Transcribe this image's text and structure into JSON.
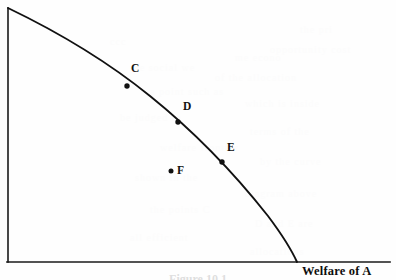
{
  "figure": {
    "caption": "Figure 10.1",
    "background_color": "#fefefe",
    "ink_color": "#111111"
  },
  "axes": {
    "x_label": "Welfare of A",
    "y_label": "",
    "x_axis_name": "horizontal-axis",
    "y_axis_name": "vertical-axis",
    "origin_px": [
      8,
      262
    ],
    "x_axis_end_px": [
      390,
      262
    ],
    "y_axis_end_px": [
      8,
      8
    ]
  },
  "chart_data": {
    "type": "line",
    "title": "",
    "subtitle": "",
    "xlabel": "Welfare of A",
    "ylabel": "",
    "xlim": [
      0,
      1
    ],
    "ylim": [
      0,
      1
    ],
    "grid": false,
    "legend": "none",
    "series": [
      {
        "name": "utility-possibility-frontier",
        "description": "Concave welfare frontier falling from the vertical axis to the horizontal axis",
        "x": [
          0.0,
          0.08,
          0.17,
          0.25,
          0.34,
          0.42,
          0.5,
          0.57,
          0.63,
          0.68,
          0.72,
          0.75,
          0.755
        ],
        "y": [
          1.0,
          0.93,
          0.86,
          0.79,
          0.71,
          0.63,
          0.54,
          0.44,
          0.34,
          0.24,
          0.14,
          0.05,
          0.0
        ]
      }
    ],
    "points": [
      {
        "label": "C",
        "x": 0.313,
        "y": 0.693,
        "px": [
          127,
          86
        ],
        "label_px": [
          131,
          63
        ],
        "on_frontier": true
      },
      {
        "label": "D",
        "x": 0.447,
        "y": 0.551,
        "px": [
          178,
          122
        ],
        "label_px": [
          183,
          101
        ],
        "on_frontier": true
      },
      {
        "label": "E",
        "x": 0.562,
        "y": 0.394,
        "px": [
          222,
          162
        ],
        "label_px": [
          227,
          142
        ],
        "on_frontier": true
      },
      {
        "label": "F",
        "x": 0.43,
        "y": 0.362,
        "px": [
          171,
          171
        ],
        "label_px": [
          177,
          165
        ],
        "on_frontier": false
      }
    ],
    "annotations": [
      "C, D and E lie on the frontier",
      "F lies inside the frontier"
    ]
  },
  "ghost_text": {
    "note": "faint show-through of text from the reverse side of the page",
    "lines": [
      {
        "text": "the pri",
        "x": 300,
        "y": 24
      },
      {
        "text": "ccc",
        "x": 110,
        "y": 36
      },
      {
        "text": "opportunity cost",
        "x": 270,
        "y": 44
      },
      {
        "text": "me econo",
        "x": 235,
        "y": 52
      },
      {
        "text": "the social we",
        "x": 130,
        "y": 62
      },
      {
        "text": "of the allocation",
        "x": 215,
        "y": 72
      },
      {
        "text": "a point such as",
        "x": 150,
        "y": 86
      },
      {
        "text": "which is inside",
        "x": 245,
        "y": 98
      },
      {
        "text": "be judged in",
        "x": 120,
        "y": 112
      },
      {
        "text": "terms of the",
        "x": 250,
        "y": 126
      },
      {
        "text": "welfare frontier",
        "x": 160,
        "y": 142
      },
      {
        "text": "by the curve",
        "x": 260,
        "y": 156
      },
      {
        "text": "shown in the",
        "x": 135,
        "y": 172
      },
      {
        "text": "diagram above",
        "x": 245,
        "y": 188
      },
      {
        "text": "the points C",
        "x": 150,
        "y": 204
      },
      {
        "text": "D and E are",
        "x": 255,
        "y": 218
      },
      {
        "text": "all efficient",
        "x": 130,
        "y": 232
      },
      {
        "text": "allocations",
        "x": 250,
        "y": 246
      }
    ]
  }
}
